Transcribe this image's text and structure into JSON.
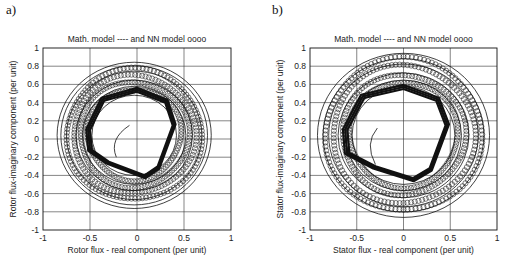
{
  "panels": [
    {
      "label": "a)",
      "title": "Math. model ----  and  NN model  oooo",
      "xlabel": "Rotor flux - real component  (per unit)",
      "ylabel": "Rotor flux-imaginary component (per unit)"
    },
    {
      "label": "b)",
      "title": "Math. model ----  and  NN model  oooo",
      "xlabel": "Stator flux - real component  (per unit)",
      "ylabel": "Stator flux-imaginary component (per unit)"
    }
  ],
  "chart_data": [
    {
      "type": "line",
      "title": "Math. model ----  and  NN model  oooo",
      "xlabel": "Rotor flux - real component  (per unit)",
      "ylabel": "Rotor flux-imaginary component (per unit)",
      "xlim": [
        -1,
        1
      ],
      "ylim": [
        -1,
        1
      ],
      "xticks": [
        -1,
        -0.5,
        0,
        0.5,
        1
      ],
      "yticks": [
        -1,
        -0.8,
        -0.6,
        -0.4,
        -0.2,
        0,
        0.2,
        0.4,
        0.6,
        0.8,
        1
      ],
      "grid": true,
      "legend": "in title: Math. model (solid line), NN model (circles)",
      "series": [
        {
          "name": "Math. model",
          "style": "solid line",
          "description": "spiral flux trajectory starting near (-0.1, 0.15), forming a rounded polygonal loop of radius ~0.4-0.55 then expanding rings to radius ~0.8",
          "ring_radii": [
            0.45,
            0.55,
            0.62,
            0.72,
            0.78,
            0.82
          ]
        },
        {
          "name": "NN model",
          "style": "circles",
          "description": "circle markers tracking the math model trajectory",
          "ring_radii": [
            0.5,
            0.58,
            0.65,
            0.72
          ]
        }
      ]
    },
    {
      "type": "line",
      "title": "Math. model ----  and  NN model  oooo",
      "xlabel": "Stator flux - real component  (per unit)",
      "ylabel": "Stator flux-imaginary component (per unit)",
      "xlim": [
        -1,
        1
      ],
      "ylim": [
        -1,
        1
      ],
      "xticks": [
        -1,
        -0.5,
        0,
        0.5,
        1
      ],
      "yticks": [
        -1,
        -0.8,
        -0.6,
        -0.4,
        -0.2,
        0,
        0.2,
        0.4,
        0.6,
        0.8,
        1
      ],
      "grid": true,
      "legend": "in title: Math. model (solid line), NN model (circles)",
      "series": [
        {
          "name": "Math. model",
          "style": "solid line",
          "description": "spiral flux trajectory starting near (-0.3, 0.1), forming a rounded polygonal loop of radius ~0.45-0.6 then expanding rings to radius ~0.92",
          "ring_radii": [
            0.55,
            0.62,
            0.7,
            0.8,
            0.86,
            0.92
          ]
        },
        {
          "name": "NN model",
          "style": "circles",
          "description": "circle markers tracking the math model trajectory",
          "ring_radii": [
            0.58,
            0.66,
            0.76,
            0.84
          ]
        }
      ]
    }
  ]
}
